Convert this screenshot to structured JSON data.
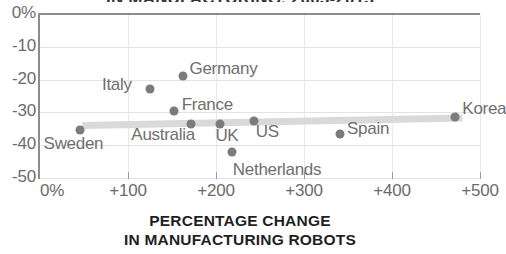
{
  "chart_data": {
    "type": "scatter",
    "title": "IN MANUFACTURING, 2005-2015",
    "xlabel_line1": "PERCENTAGE CHANGE",
    "xlabel_line2": "IN MANUFACTURING ROBOTS",
    "ylabel": "",
    "xlim": [
      0,
      500
    ],
    "ylim": [
      -50,
      0
    ],
    "grid": true,
    "legend": "none",
    "xticks": [
      "0%",
      "+100",
      "+200",
      "+300",
      "+400",
      "+500"
    ],
    "xtick_values": [
      0,
      100,
      200,
      300,
      400,
      500
    ],
    "yticks": [
      "0%",
      "-10",
      "-20",
      "-30",
      "-40",
      "-50"
    ],
    "ytick_values": [
      0,
      -10,
      -20,
      -30,
      -40,
      -50
    ],
    "points": [
      {
        "label": "Sweden",
        "x": 45,
        "y": -35.5,
        "label_dx": -36,
        "label_dy": 16
      },
      {
        "label": "Italy",
        "x": 125,
        "y": -23,
        "label_dx": -48,
        "label_dy": -2
      },
      {
        "label": "Germany",
        "x": 162,
        "y": -19,
        "label_dx": 7,
        "label_dy": -5
      },
      {
        "label": "France",
        "x": 152,
        "y": -29.5,
        "label_dx": 8,
        "label_dy": -4
      },
      {
        "label": "Australia",
        "x": 172,
        "y": -33.5,
        "label_dx": -60,
        "label_dy": 13
      },
      {
        "label": "UK",
        "x": 205,
        "y": -33.5,
        "label_dx": -5,
        "label_dy": 14
      },
      {
        "label": "US",
        "x": 243,
        "y": -32.5,
        "label_dx": 2,
        "label_dy": 13
      },
      {
        "label": "Netherlands",
        "x": 218,
        "y": -42,
        "label_dx": 1,
        "label_dy": 20
      },
      {
        "label": "Spain",
        "x": 341,
        "y": -36.5,
        "label_dx": 7,
        "label_dy": -3
      },
      {
        "label": "Korea",
        "x": 472,
        "y": -31.5,
        "label_dx": 7,
        "label_dy": -6
      }
    ],
    "trendline": {
      "x_start": 48,
      "y_start": -34.0,
      "x_end": 480,
      "y_end": -31.7,
      "color": "#d9d9d9"
    },
    "colors": {
      "dot": "#7b7b7b",
      "axis": "#8c8c8c",
      "grid": "#e3e3e3",
      "tick_text": "#6b6b6b",
      "label_text": "#6f6f6f",
      "title_text": "#1f1f1f",
      "background": "#ffffff"
    }
  }
}
